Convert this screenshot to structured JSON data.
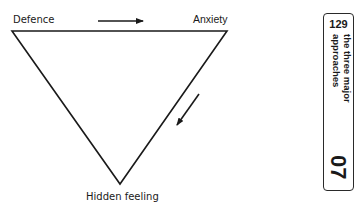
{
  "diagram": {
    "type": "inverted-triangle",
    "nodes": {
      "top_left": "Defence",
      "top_right": "Anxiety",
      "bottom": "Hidden feeling"
    },
    "arrows": [
      {
        "from": "Defence",
        "to": "Anxiety",
        "direction": "right"
      },
      {
        "from": "Anxiety",
        "to": "Hidden feeling",
        "direction": "down-left"
      }
    ],
    "stroke_color": "#1a1a1a"
  },
  "side_tab": {
    "page_number": "129",
    "chapter_title": "the three major approaches",
    "chapter_number": "07"
  }
}
